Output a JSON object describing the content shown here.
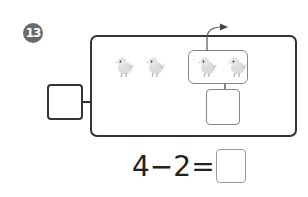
{
  "problem": {
    "number": "13",
    "birds": {
      "total": 4,
      "ungrouped": 2,
      "grouped_flying_away": 2
    },
    "equation": {
      "left": "4",
      "operator": "−",
      "right": "2",
      "equals": "=",
      "answer": ""
    },
    "answer_boxes": {
      "total_box": "",
      "group_box": ""
    }
  }
}
